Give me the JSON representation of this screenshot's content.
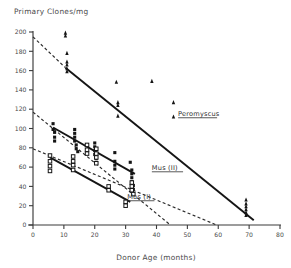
{
  "chart_data": {
    "type": "scatter",
    "title": "Primary Clones/mg",
    "xlabel": "Donor Age (months)",
    "ylabel": "Primary Clones/mg",
    "xlim": [
      0,
      80
    ],
    "ylim": [
      0,
      200
    ],
    "xticks": [
      0,
      10,
      20,
      30,
      40,
      50,
      60,
      70,
      80
    ],
    "yticks": [
      0,
      20,
      40,
      60,
      80,
      100,
      120,
      140,
      160,
      180,
      200
    ],
    "grid": false,
    "legend_position": "inline-annotations",
    "series": [
      {
        "name": "Peromyscus",
        "marker": "filled-triangle",
        "label": "Peromyscus",
        "label_underlined": true,
        "label_x": 47,
        "label_y": 113,
        "fit_solid": {
          "x0": 10.5,
          "y0": 163,
          "x1": 71.5,
          "y1": 5
        },
        "fit_dashed": {
          "x0": 0.0,
          "y0": 195,
          "x1": 10.5,
          "y1": 163
        },
        "points": [
          {
            "x": 10.5,
            "y": 199
          },
          {
            "x": 10.5,
            "y": 196
          },
          {
            "x": 11.0,
            "y": 178
          },
          {
            "x": 11.0,
            "y": 169
          },
          {
            "x": 11.0,
            "y": 166
          },
          {
            "x": 11.0,
            "y": 162
          },
          {
            "x": 11.0,
            "y": 159
          },
          {
            "x": 27.0,
            "y": 148
          },
          {
            "x": 27.5,
            "y": 127
          },
          {
            "x": 27.5,
            "y": 124
          },
          {
            "x": 27.5,
            "y": 113
          },
          {
            "x": 38.5,
            "y": 149
          },
          {
            "x": 45.5,
            "y": 127
          },
          {
            "x": 45.5,
            "y": 112
          },
          {
            "x": 69.0,
            "y": 26
          },
          {
            "x": 69.0,
            "y": 22
          },
          {
            "x": 69.0,
            "y": 19
          },
          {
            "x": 69.0,
            "y": 16
          },
          {
            "x": 69.0,
            "y": 13
          },
          {
            "x": 69.0,
            "y": 10
          }
        ]
      },
      {
        "name": "Mus (II)",
        "marker": "filled-square",
        "label": "Mus (II)",
        "label_underlined": true,
        "label_x": 38.5,
        "label_y": 57,
        "fit_solid": {
          "x0": 6.5,
          "y0": 101,
          "x1": 33.0,
          "y1": 53
        },
        "fit_dashed": {
          "x0": 0.0,
          "y0": 117,
          "x1": 44.5,
          "y1": 0
        },
        "points": [
          {
            "x": 6.5,
            "y": 105
          },
          {
            "x": 6.5,
            "y": 99
          },
          {
            "x": 7.0,
            "y": 96
          },
          {
            "x": 7.0,
            "y": 91
          },
          {
            "x": 7.0,
            "y": 87
          },
          {
            "x": 13.5,
            "y": 99
          },
          {
            "x": 13.5,
            "y": 95
          },
          {
            "x": 13.5,
            "y": 91
          },
          {
            "x": 13.5,
            "y": 87
          },
          {
            "x": 14.0,
            "y": 83
          },
          {
            "x": 14.0,
            "y": 79
          },
          {
            "x": 14.5,
            "y": 76
          },
          {
            "x": 20.0,
            "y": 85
          },
          {
            "x": 20.0,
            "y": 81
          },
          {
            "x": 20.0,
            "y": 77
          },
          {
            "x": 20.0,
            "y": 73
          },
          {
            "x": 20.5,
            "y": 69
          },
          {
            "x": 20.5,
            "y": 65
          },
          {
            "x": 26.5,
            "y": 75
          },
          {
            "x": 26.5,
            "y": 66
          },
          {
            "x": 26.5,
            "y": 62
          },
          {
            "x": 26.5,
            "y": 58
          },
          {
            "x": 31.5,
            "y": 65
          },
          {
            "x": 32.0,
            "y": 57
          },
          {
            "x": 32.0,
            "y": 53
          },
          {
            "x": 32.0,
            "y": 49
          },
          {
            "x": 32.0,
            "y": 45
          },
          {
            "x": 32.5,
            "y": 41
          },
          {
            "x": 32.5,
            "y": 37
          }
        ]
      },
      {
        "name": "Mus (I)",
        "marker": "open-square",
        "label": "Mus (I)",
        "label_underlined": true,
        "label_x": 30.5,
        "label_y": 27,
        "fit_solid": {
          "x0": 5.5,
          "y0": 70,
          "x1": 31.5,
          "y1": 24
        },
        "fit_dashed": {
          "x0": 0.0,
          "y0": 79,
          "x1": 59.5,
          "y1": 0
        },
        "points": [
          {
            "x": 5.5,
            "y": 72
          },
          {
            "x": 5.5,
            "y": 66
          },
          {
            "x": 5.5,
            "y": 61
          },
          {
            "x": 5.5,
            "y": 56
          },
          {
            "x": 13.0,
            "y": 71
          },
          {
            "x": 13.0,
            "y": 66
          },
          {
            "x": 13.0,
            "y": 62
          },
          {
            "x": 13.0,
            "y": 57
          },
          {
            "x": 17.5,
            "y": 83
          },
          {
            "x": 17.5,
            "y": 78
          },
          {
            "x": 17.5,
            "y": 74
          },
          {
            "x": 20.5,
            "y": 79
          },
          {
            "x": 20.5,
            "y": 74
          },
          {
            "x": 20.5,
            "y": 70
          },
          {
            "x": 20.5,
            "y": 64
          },
          {
            "x": 24.5,
            "y": 40
          },
          {
            "x": 24.5,
            "y": 36
          },
          {
            "x": 30.0,
            "y": 24
          },
          {
            "x": 30.0,
            "y": 20
          },
          {
            "x": 32.0,
            "y": 44
          },
          {
            "x": 32.0,
            "y": 40
          },
          {
            "x": 32.0,
            "y": 36
          },
          {
            "x": 32.5,
            "y": 32
          }
        ]
      }
    ]
  },
  "figure": {
    "title": "Primary Clones/mg",
    "xlabel": "Donor Age (months)"
  }
}
